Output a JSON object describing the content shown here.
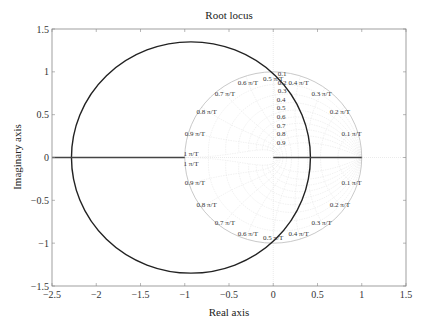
{
  "chart_data": {
    "type": "line",
    "title": "Root locus",
    "xlabel": "Real axis",
    "ylabel": "Imaginary axis",
    "xlim": [
      -2.5,
      1.5
    ],
    "ylim": [
      -1.5,
      1.5
    ],
    "xticks": [
      "-2.5",
      "-2",
      "-1.5",
      "-1",
      "-0.5",
      "0",
      "0.5",
      "1",
      "1.5"
    ],
    "yticks": [
      "1.5",
      "1",
      "0.5",
      "0",
      "-0.5",
      "-1",
      "-1.5"
    ],
    "grid": "zgrid (unit circle, damping and natural frequency lines)",
    "series": [
      {
        "name": "locus circle",
        "shape": "circle",
        "center": [
          -0.93,
          0
        ],
        "radius": 1.35
      },
      {
        "name": "real-axis branch left",
        "x": [
          -2.5,
          -1.0
        ],
        "y": [
          0,
          0
        ]
      },
      {
        "name": "real-axis branch right",
        "x": [
          0,
          1.0
        ],
        "y": [
          0,
          0
        ]
      }
    ],
    "unit_circle": {
      "center": [
        0,
        0
      ],
      "radius": 1
    },
    "damping_labels": [
      "0.1",
      "0.2",
      "0.3",
      "0.4",
      "0.5",
      "0.6",
      "0.7",
      "0.8",
      "0.9"
    ],
    "frequency_labels_upper": [
      "0.1 π/T",
      "0.2 π/T",
      "0.3 π/T",
      "0.4 π/T",
      "0.5 π/T",
      "0.6 π/T",
      "0.7 π/T",
      "0.8 π/T",
      "0.9 π/T",
      "1 π/T"
    ],
    "frequency_labels_lower": [
      "0.1 π/T",
      "0.2 π/T",
      "0.3 π/T",
      "0.4 π/T",
      "0.5 π/T",
      "0.6 π/T",
      "0.7 π/T",
      "0.8 π/T",
      "0.9 π/T",
      "1 π/T"
    ]
  },
  "colors": {
    "locus": "#222222",
    "grid": "#bbbbbb",
    "axis": "#888888"
  }
}
